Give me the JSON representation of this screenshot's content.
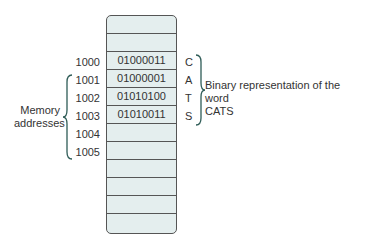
{
  "memory": {
    "cells": [
      {
        "address": "",
        "value": "",
        "char": ""
      },
      {
        "address": "",
        "value": "",
        "char": ""
      },
      {
        "address": "1000",
        "value": "01000011",
        "char": "C"
      },
      {
        "address": "1001",
        "value": "01000001",
        "char": "A"
      },
      {
        "address": "1002",
        "value": "01010100",
        "char": "T"
      },
      {
        "address": "1003",
        "value": "01010011",
        "char": "S"
      },
      {
        "address": "1004",
        "value": "",
        "char": ""
      },
      {
        "address": "1005",
        "value": "",
        "char": ""
      },
      {
        "address": "",
        "value": "",
        "char": ""
      },
      {
        "address": "",
        "value": "",
        "char": ""
      },
      {
        "address": "",
        "value": "",
        "char": ""
      },
      {
        "address": "",
        "value": "",
        "char": ""
      }
    ]
  },
  "labels": {
    "memory_addresses_line1": "Memory",
    "memory_addresses_line2": "addresses",
    "binary_line1": "Binary representation of the word",
    "binary_line2": "CATS"
  },
  "colors": {
    "cell_fill": "#e4eeee",
    "border": "#555555",
    "brace": "#2f5c57"
  }
}
